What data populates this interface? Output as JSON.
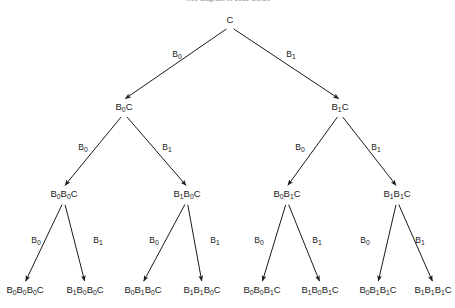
{
  "figure": {
    "title": "Tree diagram of code words",
    "type": "binary-tree-diagram",
    "background_color": "#ffffff",
    "line_color": "#1a1a1a",
    "text_color": "#1a1a1a",
    "root_symbol": "C",
    "branch_labels": {
      "left": "B0",
      "right": "B1"
    },
    "levels": 4,
    "nodes": [
      {
        "id": "n0",
        "level": 0,
        "x": 230,
        "y": 23,
        "base": "C",
        "subs": []
      },
      {
        "id": "n1",
        "level": 1,
        "x": 124,
        "y": 110,
        "base": "B C",
        "subs": [
          "0"
        ]
      },
      {
        "id": "n2",
        "level": 1,
        "x": 340,
        "y": 110,
        "base": "B C",
        "subs": [
          "1"
        ]
      },
      {
        "id": "n3",
        "level": 2,
        "x": 64,
        "y": 197,
        "base": "B B C",
        "subs": [
          "0",
          "0"
        ]
      },
      {
        "id": "n4",
        "level": 2,
        "x": 187,
        "y": 197,
        "base": "B B C",
        "subs": [
          "1",
          "0"
        ]
      },
      {
        "id": "n5",
        "level": 2,
        "x": 287,
        "y": 197,
        "base": "B B C",
        "subs": [
          "0",
          "1"
        ]
      },
      {
        "id": "n6",
        "level": 2,
        "x": 397,
        "y": 197,
        "base": "B B C",
        "subs": [
          "1",
          "1"
        ]
      },
      {
        "id": "n7",
        "level": 3,
        "x": 25,
        "y": 293,
        "base": "B B B C",
        "subs": [
          "0",
          "0",
          "0"
        ]
      },
      {
        "id": "n8",
        "level": 3,
        "x": 85,
        "y": 293,
        "base": "B B B C",
        "subs": [
          "1",
          "0",
          "0"
        ]
      },
      {
        "id": "n9",
        "level": 3,
        "x": 143,
        "y": 293,
        "base": "B B B C",
        "subs": [
          "0",
          "1",
          "0"
        ]
      },
      {
        "id": "n10",
        "level": 3,
        "x": 202,
        "y": 293,
        "base": "B B B C",
        "subs": [
          "1",
          "1",
          "0"
        ]
      },
      {
        "id": "n11",
        "level": 3,
        "x": 262,
        "y": 293,
        "base": "B B B C",
        "subs": [
          "0",
          "0",
          "1"
        ]
      },
      {
        "id": "n12",
        "level": 3,
        "x": 320,
        "y": 293,
        "base": "B B B C",
        "subs": [
          "1",
          "0",
          "1"
        ]
      },
      {
        "id": "n13",
        "level": 3,
        "x": 378,
        "y": 293,
        "base": "B B B C",
        "subs": [
          "0",
          "1",
          "1"
        ]
      },
      {
        "id": "n14",
        "level": 3,
        "x": 433,
        "y": 293,
        "base": "B B B C",
        "subs": [
          "1",
          "1",
          "1"
        ]
      }
    ],
    "edges": [
      {
        "from": "n0",
        "to": "n1",
        "label_base": "B",
        "label_sub": "0",
        "lx": 177,
        "ly": 57
      },
      {
        "from": "n0",
        "to": "n2",
        "label_base": "B",
        "label_sub": "1",
        "lx": 291,
        "ly": 57
      },
      {
        "from": "n1",
        "to": "n3",
        "label_base": "B",
        "label_sub": "0",
        "lx": 83,
        "ly": 150
      },
      {
        "from": "n1",
        "to": "n4",
        "label_base": "B",
        "label_sub": "1",
        "lx": 167,
        "ly": 150
      },
      {
        "from": "n2",
        "to": "n5",
        "label_base": "B",
        "label_sub": "0",
        "lx": 300,
        "ly": 150
      },
      {
        "from": "n2",
        "to": "n6",
        "label_base": "B",
        "label_sub": "1",
        "lx": 376,
        "ly": 150
      },
      {
        "from": "n3",
        "to": "n7",
        "label_base": "B",
        "label_sub": "0",
        "lx": 36,
        "ly": 243
      },
      {
        "from": "n3",
        "to": "n8",
        "label_base": "B",
        "label_sub": "1",
        "lx": 98,
        "ly": 243
      },
      {
        "from": "n4",
        "to": "n9",
        "label_base": "B",
        "label_sub": "0",
        "lx": 154,
        "ly": 243
      },
      {
        "from": "n4",
        "to": "n10",
        "label_base": "B",
        "label_sub": "1",
        "lx": 215,
        "ly": 243
      },
      {
        "from": "n5",
        "to": "n11",
        "label_base": "B",
        "label_sub": "0",
        "lx": 259,
        "ly": 243
      },
      {
        "from": "n5",
        "to": "n12",
        "label_base": "B",
        "label_sub": "1",
        "lx": 317,
        "ly": 243
      },
      {
        "from": "n6",
        "to": "n13",
        "label_base": "B",
        "label_sub": "0",
        "lx": 365,
        "ly": 243
      },
      {
        "from": "n6",
        "to": "n14",
        "label_base": "B",
        "label_sub": "1",
        "lx": 420,
        "ly": 243
      }
    ]
  }
}
